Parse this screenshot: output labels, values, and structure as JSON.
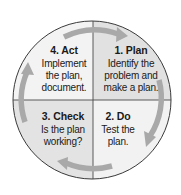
{
  "diagram": {
    "type": "cycle",
    "name": "PDCA cycle",
    "direction": "clockwise",
    "colors": {
      "outline": "#3a3a3a",
      "divider": "#4a4a4a",
      "arrow": "#a9a9a9",
      "fill_dark": "#e1e1e1",
      "fill_light": "#f3f3f3",
      "text": "#1a1a1a"
    },
    "quadrants": [
      {
        "position": "top-right",
        "title": "1. Plan",
        "lines": [
          "Identify the",
          "problem and",
          "make a plan."
        ]
      },
      {
        "position": "bottom-right",
        "title": "2. Do",
        "lines": [
          "Test the",
          "plan."
        ]
      },
      {
        "position": "bottom-left",
        "title": "3. Check",
        "lines": [
          "Is the plan",
          "working?"
        ]
      },
      {
        "position": "top-left",
        "title": "4. Act",
        "lines": [
          "Implement",
          "the plan,",
          "document."
        ]
      }
    ],
    "arrows": [
      {
        "from": "Act",
        "to": "Plan",
        "heading": "right"
      },
      {
        "from": "Plan",
        "to": "Do",
        "heading": "down"
      },
      {
        "from": "Do",
        "to": "Check",
        "heading": "left"
      },
      {
        "from": "Check",
        "to": "Act",
        "heading": "up"
      }
    ]
  }
}
